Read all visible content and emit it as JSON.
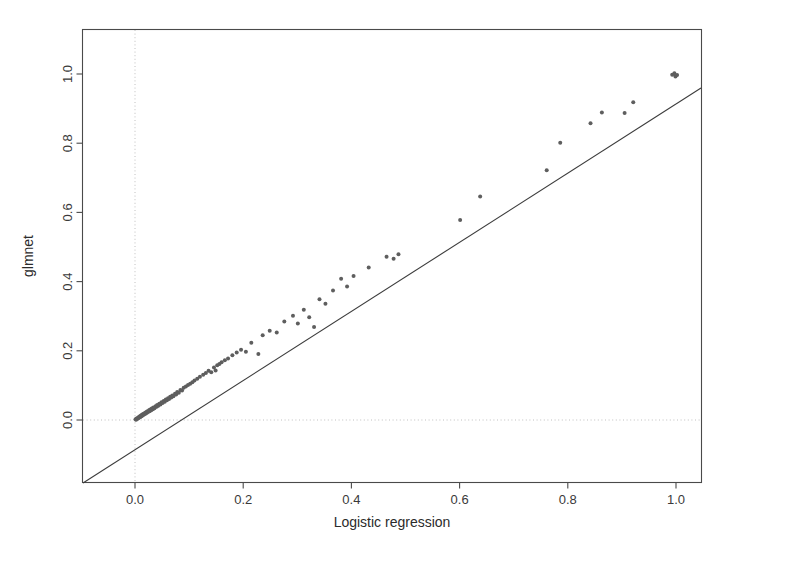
{
  "chart_data": {
    "type": "scatter",
    "title": "",
    "xlabel": "Logistic regression",
    "ylabel": "glmnet",
    "xlim": [
      -0.148,
      1.148
    ],
    "ylim": [
      -0.168,
      1.168
    ],
    "xticks": [
      0.0,
      0.2,
      0.4,
      0.6,
      0.8,
      1.0
    ],
    "xtick_labels": [
      "0.0",
      "0.2",
      "0.4",
      "0.6",
      "0.8",
      "1.0"
    ],
    "yticks": [
      0.0,
      0.2,
      0.4,
      0.6,
      0.8,
      1.0
    ],
    "ytick_labels": [
      "0.0",
      "0.2",
      "0.4",
      "0.6",
      "0.8",
      "1.0"
    ],
    "grid": "dotted reference lines at x=0 and y=0",
    "grid_lines": [
      {
        "orientation": "vertical",
        "value": 0.0
      },
      {
        "orientation": "horizontal",
        "value": 0.0
      }
    ],
    "reference_line": {
      "kind": "identity",
      "label": "y = x",
      "slope": 1.0,
      "intercept": 0.0
    },
    "legend": null,
    "point_color": "#5e5e5e",
    "point_radius_px": 2.0,
    "n_points": 108,
    "x": [
      0.001,
      0.002,
      0.003,
      0.004,
      0.005,
      0.006,
      0.007,
      0.008,
      0.009,
      0.01,
      0.011,
      0.012,
      0.013,
      0.014,
      0.015,
      0.016,
      0.017,
      0.018,
      0.019,
      0.02,
      0.021,
      0.022,
      0.023,
      0.024,
      0.026,
      0.027,
      0.028,
      0.03,
      0.031,
      0.033,
      0.034,
      0.036,
      0.038,
      0.04,
      0.041,
      0.043,
      0.045,
      0.047,
      0.049,
      0.051,
      0.053,
      0.055,
      0.057,
      0.059,
      0.061,
      0.063,
      0.065,
      0.067,
      0.069,
      0.071,
      0.074,
      0.076,
      0.078,
      0.081,
      0.084,
      0.087,
      0.09,
      0.094,
      0.098,
      0.102,
      0.106,
      0.11,
      0.115,
      0.12,
      0.126,
      0.131,
      0.136,
      0.141,
      0.146,
      0.149,
      0.152,
      0.156,
      0.16,
      0.166,
      0.172,
      0.18,
      0.188,
      0.196,
      0.205,
      0.215,
      0.228,
      0.236,
      0.249,
      0.262,
      0.276,
      0.292,
      0.301,
      0.312,
      0.322,
      0.331,
      0.341,
      0.352,
      0.366,
      0.381,
      0.392,
      0.404,
      0.432,
      0.465,
      0.478,
      0.487,
      0.601,
      0.638,
      0.761,
      0.786,
      0.842,
      0.863,
      0.905,
      0.921
    ],
    "y": [
      0.002,
      0.001,
      0.004,
      0.003,
      0.006,
      0.005,
      0.009,
      0.007,
      0.011,
      0.009,
      0.013,
      0.011,
      0.015,
      0.013,
      0.017,
      0.015,
      0.019,
      0.017,
      0.021,
      0.019,
      0.023,
      0.021,
      0.025,
      0.023,
      0.028,
      0.025,
      0.03,
      0.028,
      0.033,
      0.031,
      0.036,
      0.034,
      0.04,
      0.038,
      0.043,
      0.041,
      0.047,
      0.045,
      0.051,
      0.049,
      0.055,
      0.053,
      0.059,
      0.057,
      0.063,
      0.061,
      0.067,
      0.065,
      0.071,
      0.069,
      0.076,
      0.074,
      0.081,
      0.079,
      0.087,
      0.085,
      0.093,
      0.097,
      0.101,
      0.105,
      0.109,
      0.114,
      0.119,
      0.125,
      0.131,
      0.136,
      0.142,
      0.138,
      0.152,
      0.143,
      0.158,
      0.162,
      0.167,
      0.173,
      0.178,
      0.187,
      0.195,
      0.203,
      0.197,
      0.223,
      0.191,
      0.245,
      0.258,
      0.253,
      0.285,
      0.301,
      0.279,
      0.319,
      0.297,
      0.269,
      0.349,
      0.336,
      0.374,
      0.408,
      0.386,
      0.416,
      0.441,
      0.472,
      0.466,
      0.479,
      0.578,
      0.646,
      0.722,
      0.801,
      0.858,
      0.889,
      0.887,
      0.918
    ],
    "dense_cluster_note": "majority of observations concentrate in [0, 0.15] on both axes",
    "top_right_cluster": {
      "x": 0.997,
      "y": 0.996,
      "count": 4
    }
  },
  "axes": {
    "x_title": "Logistic regression",
    "y_title": "glmnet"
  }
}
